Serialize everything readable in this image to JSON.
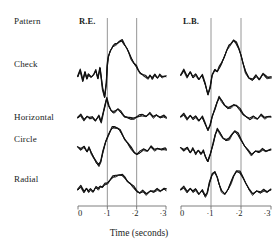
{
  "figure": {
    "row_header_label": "Pattern",
    "row_labels": [
      "Check",
      "Horizontal",
      "Circle",
      "Radial"
    ],
    "panels": [
      {
        "label": "R.E."
      },
      {
        "label": "L.B."
      }
    ],
    "x_axis": {
      "title": "Time (seconds)",
      "tick_labels": [
        "0",
        "·1",
        "·2",
        "·3"
      ],
      "marker_lines": [
        "·1",
        "·2"
      ]
    },
    "colors": {
      "trace": "#111111",
      "axis": "#6f6f6f",
      "marker_line": "#8a8a8a",
      "text": "#201d1b",
      "background": "#ffffff"
    }
  },
  "chart_data": {
    "type": "line",
    "title": "",
    "subtitle": "",
    "xlabel": "Time (seconds)",
    "ylabel": "",
    "xlim": [
      0,
      0.3
    ],
    "ylim": [
      0,
      1
    ],
    "grid": false,
    "legend_position": "none",
    "annotations": [
      "Pattern",
      "R.E.",
      "L.B."
    ],
    "marker_lines_x": [
      0.1,
      0.2
    ],
    "xtick_values": [
      0,
      0.1,
      0.2,
      0.3
    ],
    "xtick_labels": [
      "0",
      "·1",
      "·2",
      "·3"
    ],
    "panels": [
      {
        "name": "R.E.",
        "rows": [
          {
            "name": "Check",
            "repeats": 3,
            "x": [
              0.0,
              0.008,
              0.016,
              0.023,
              0.03,
              0.037,
              0.045,
              0.052,
              0.06,
              0.068,
              0.076,
              0.084,
              0.09,
              0.096,
              0.1,
              0.104,
              0.11,
              0.118,
              0.126,
              0.134,
              0.142,
              0.15,
              0.158,
              0.166,
              0.174,
              0.182,
              0.19,
              0.198,
              0.206,
              0.214,
              0.222,
              0.23,
              0.238,
              0.246,
              0.254,
              0.262,
              0.27,
              0.278,
              0.286,
              0.294,
              0.3
            ],
            "y": [
              0.42,
              0.52,
              0.36,
              0.5,
              0.38,
              0.46,
              0.42,
              0.44,
              0.52,
              0.4,
              0.56,
              0.22,
              0.1,
              0.32,
              0.58,
              0.74,
              0.84,
              0.9,
              0.94,
              0.96,
              0.98,
              1.0,
              0.94,
              0.88,
              0.8,
              0.72,
              0.64,
              0.58,
              0.52,
              0.48,
              0.44,
              0.42,
              0.4,
              0.44,
              0.38,
              0.46,
              0.4,
              0.44,
              0.42,
              0.43,
              0.42
            ]
          },
          {
            "name": "Horizontal",
            "repeats": 3,
            "x": [
              0.0,
              0.01,
              0.02,
              0.03,
              0.04,
              0.05,
              0.06,
              0.07,
              0.078,
              0.086,
              0.092,
              0.098,
              0.104,
              0.112,
              0.12,
              0.128,
              0.136,
              0.144,
              0.152,
              0.16,
              0.17,
              0.18,
              0.19,
              0.2,
              0.21,
              0.22,
              0.232,
              0.244,
              0.256,
              0.268,
              0.28,
              0.292,
              0.3
            ],
            "y": [
              0.4,
              0.46,
              0.36,
              0.44,
              0.38,
              0.42,
              0.34,
              0.44,
              0.3,
              0.52,
              0.66,
              0.86,
              0.7,
              0.58,
              0.52,
              0.56,
              0.62,
              0.54,
              0.48,
              0.44,
              0.4,
              0.38,
              0.4,
              0.42,
              0.44,
              0.48,
              0.44,
              0.5,
              0.42,
              0.48,
              0.4,
              0.44,
              0.42
            ]
          },
          {
            "name": "Circle",
            "repeats": 3,
            "x": [
              0.0,
              0.01,
              0.02,
              0.03,
              0.038,
              0.046,
              0.054,
              0.062,
              0.07,
              0.078,
              0.086,
              0.094,
              0.102,
              0.11,
              0.118,
              0.126,
              0.134,
              0.142,
              0.15,
              0.16,
              0.17,
              0.18,
              0.19,
              0.2,
              0.212,
              0.224,
              0.236,
              0.248,
              0.26,
              0.272,
              0.284,
              0.296,
              0.3
            ],
            "y": [
              0.46,
              0.4,
              0.48,
              0.36,
              0.44,
              0.34,
              0.24,
              0.12,
              0.06,
              0.16,
              0.36,
              0.56,
              0.72,
              0.82,
              0.88,
              0.9,
              0.88,
              0.82,
              0.74,
              0.64,
              0.54,
              0.44,
              0.36,
              0.3,
              0.34,
              0.42,
              0.38,
              0.46,
              0.4,
              0.44,
              0.4,
              0.42,
              0.42
            ]
          },
          {
            "name": "Radial",
            "repeats": 3,
            "x": [
              0.0,
              0.01,
              0.02,
              0.028,
              0.036,
              0.044,
              0.052,
              0.06,
              0.068,
              0.076,
              0.084,
              0.092,
              0.1,
              0.11,
              0.12,
              0.13,
              0.14,
              0.15,
              0.16,
              0.17,
              0.18,
              0.19,
              0.2,
              0.21,
              0.222,
              0.234,
              0.246,
              0.258,
              0.27,
              0.282,
              0.294,
              0.3
            ],
            "y": [
              0.4,
              0.48,
              0.36,
              0.44,
              0.34,
              0.42,
              0.36,
              0.46,
              0.42,
              0.5,
              0.46,
              0.54,
              0.58,
              0.66,
              0.72,
              0.76,
              0.78,
              0.76,
              0.7,
              0.62,
              0.54,
              0.46,
              0.38,
              0.32,
              0.36,
              0.3,
              0.38,
              0.34,
              0.42,
              0.38,
              0.42,
              0.4
            ]
          }
        ]
      },
      {
        "name": "L.B.",
        "rows": [
          {
            "name": "Check",
            "repeats": 3,
            "x": [
              0.0,
              0.01,
              0.02,
              0.03,
              0.04,
              0.05,
              0.06,
              0.07,
              0.08,
              0.09,
              0.098,
              0.104,
              0.112,
              0.12,
              0.128,
              0.136,
              0.144,
              0.152,
              0.16,
              0.168,
              0.176,
              0.184,
              0.192,
              0.2,
              0.208,
              0.216,
              0.226,
              0.238,
              0.25,
              0.262,
              0.274,
              0.286,
              0.3
            ],
            "y": [
              0.44,
              0.52,
              0.42,
              0.5,
              0.4,
              0.46,
              0.38,
              0.44,
              0.3,
              0.14,
              0.24,
              0.44,
              0.54,
              0.5,
              0.56,
              0.64,
              0.74,
              0.84,
              0.92,
              0.96,
              1.0,
              0.96,
              0.88,
              0.76,
              0.62,
              0.5,
              0.4,
              0.36,
              0.44,
              0.38,
              0.46,
              0.4,
              0.42
            ]
          },
          {
            "name": "Horizontal",
            "repeats": 3,
            "x": [
              0.0,
              0.01,
              0.02,
              0.03,
              0.04,
              0.05,
              0.06,
              0.07,
              0.08,
              0.09,
              0.098,
              0.104,
              0.112,
              0.12,
              0.128,
              0.136,
              0.146,
              0.156,
              0.166,
              0.176,
              0.186,
              0.196,
              0.206,
              0.218,
              0.23,
              0.242,
              0.254,
              0.266,
              0.278,
              0.29,
              0.3
            ],
            "y": [
              0.42,
              0.48,
              0.38,
              0.46,
              0.36,
              0.44,
              0.34,
              0.42,
              0.26,
              0.12,
              0.22,
              0.42,
              0.62,
              0.78,
              0.88,
              0.82,
              0.7,
              0.62,
              0.66,
              0.72,
              0.68,
              0.6,
              0.5,
              0.42,
              0.36,
              0.44,
              0.38,
              0.46,
              0.4,
              0.44,
              0.42
            ]
          },
          {
            "name": "Circle",
            "repeats": 3,
            "x": [
              0.0,
              0.01,
              0.02,
              0.03,
              0.04,
              0.05,
              0.058,
              0.066,
              0.074,
              0.082,
              0.09,
              0.098,
              0.106,
              0.114,
              0.122,
              0.13,
              0.14,
              0.15,
              0.16,
              0.17,
              0.18,
              0.19,
              0.2,
              0.212,
              0.224,
              0.236,
              0.248,
              0.26,
              0.272,
              0.284,
              0.3
            ],
            "y": [
              0.44,
              0.38,
              0.46,
              0.34,
              0.42,
              0.32,
              0.4,
              0.3,
              0.38,
              0.26,
              0.14,
              0.3,
              0.54,
              0.74,
              0.84,
              0.78,
              0.66,
              0.6,
              0.64,
              0.74,
              0.8,
              0.74,
              0.62,
              0.48,
              0.38,
              0.3,
              0.38,
              0.34,
              0.42,
              0.38,
              0.4
            ]
          },
          {
            "name": "Radial",
            "repeats": 3,
            "x": [
              0.0,
              0.01,
              0.02,
              0.03,
              0.04,
              0.05,
              0.06,
              0.07,
              0.08,
              0.088,
              0.096,
              0.104,
              0.112,
              0.12,
              0.128,
              0.136,
              0.146,
              0.156,
              0.166,
              0.176,
              0.186,
              0.196,
              0.206,
              0.216,
              0.228,
              0.24,
              0.252,
              0.264,
              0.276,
              0.288,
              0.3
            ],
            "y": [
              0.4,
              0.46,
              0.36,
              0.44,
              0.34,
              0.42,
              0.3,
              0.38,
              0.24,
              0.34,
              0.58,
              0.78,
              0.86,
              0.72,
              0.52,
              0.38,
              0.3,
              0.4,
              0.58,
              0.76,
              0.86,
              0.84,
              0.72,
              0.56,
              0.4,
              0.3,
              0.38,
              0.32,
              0.4,
              0.36,
              0.4
            ]
          }
        ]
      }
    ]
  }
}
